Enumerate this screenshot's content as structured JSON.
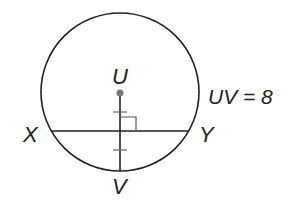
{
  "diagram": {
    "points": {
      "U": {
        "label": "U"
      },
      "V": {
        "label": "V"
      },
      "X": {
        "label": "X"
      },
      "Y": {
        "label": "Y"
      }
    },
    "measurement": "UV = 8",
    "colors": {
      "stroke": "#222222",
      "center_dot": "#777777"
    }
  }
}
